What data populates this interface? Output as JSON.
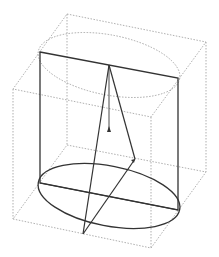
{
  "figure": {
    "colors": {
      "background": "#ffffff",
      "solid_stroke": "#333333",
      "dotted_stroke": "#999999"
    },
    "cube": {
      "top": [
        [
          67,
          14
        ],
        [
          206,
          42
        ],
        [
          151,
          117
        ],
        [
          13,
          89
        ]
      ],
      "bottom": [
        [
          67,
          145
        ],
        [
          206,
          172
        ],
        [
          151,
          248
        ],
        [
          13,
          219
        ]
      ]
    },
    "cylinder": {
      "top_ellipse": {
        "cx": 109,
        "cy": 65,
        "rx": 72,
        "ry": 30
      },
      "bottom_ellipse": {
        "cx": 109,
        "cy": 196,
        "rx": 72,
        "ry": 30
      },
      "front_rect": [
        [
          40,
          52
        ],
        [
          178,
          78
        ],
        [
          178,
          210
        ],
        [
          40,
          183
        ]
      ]
    },
    "cone": {
      "apex": [
        109,
        65
      ],
      "base_points": [
        [
          83,
          234
        ],
        [
          135,
          159
        ]
      ],
      "center": [
        109,
        196
      ],
      "axis_arrow_tip": [
        109,
        130
      ]
    }
  }
}
